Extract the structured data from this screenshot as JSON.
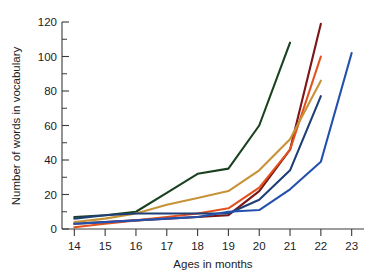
{
  "chart_data": {
    "type": "line",
    "title": "",
    "xlabel": "Ages in months",
    "ylabel": "Number of words in vocabulary",
    "x": [
      14,
      15,
      16,
      17,
      18,
      19,
      20,
      21,
      22,
      23
    ],
    "xlim": [
      13.6,
      23.4
    ],
    "ylim": [
      0,
      120
    ],
    "xticks": [
      "14",
      "15",
      "16",
      "17",
      "18",
      "19",
      "20",
      "21",
      "22",
      "23"
    ],
    "yticks": [
      "0",
      "20",
      "40",
      "60",
      "80",
      "100",
      "120"
    ],
    "ytick_values": [
      0,
      20,
      40,
      60,
      80,
      100,
      120
    ],
    "minor_ticks": true,
    "grid": false,
    "legend": "none",
    "series": [
      {
        "name": "child-1",
        "color": "#1b4220",
        "x": [
          14,
          15,
          16,
          17,
          18,
          19,
          20,
          21
        ],
        "values": [
          7,
          8,
          10,
          21,
          32,
          35,
          60,
          108
        ]
      },
      {
        "name": "child-2",
        "color": "#7d1416",
        "x": [
          14,
          15,
          16,
          17,
          18,
          19,
          20,
          21,
          22
        ],
        "values": [
          3,
          4,
          5,
          6,
          7,
          8,
          22,
          46,
          119
        ]
      },
      {
        "name": "child-3",
        "color": "#e2521d",
        "x": [
          14,
          15,
          16,
          17,
          18,
          19,
          20,
          21,
          22
        ],
        "values": [
          1,
          3,
          5,
          7,
          9,
          12,
          24,
          46,
          100
        ]
      },
      {
        "name": "child-4",
        "color": "#c79338",
        "x": [
          14,
          15,
          16,
          17,
          18,
          19,
          20,
          21,
          22
        ],
        "values": [
          4,
          6,
          9,
          14,
          18,
          22,
          34,
          52,
          86
        ]
      },
      {
        "name": "child-5",
        "color": "#1f3f77",
        "x": [
          14,
          15,
          16,
          17,
          18,
          19,
          20,
          21,
          22
        ],
        "values": [
          6,
          8,
          9,
          9,
          9,
          9,
          17,
          34,
          77
        ]
      },
      {
        "name": "child-6",
        "color": "#2450ad",
        "x": [
          14,
          15,
          16,
          17,
          18,
          19,
          20,
          21,
          22,
          23
        ],
        "values": [
          3,
          4,
          5,
          6,
          7,
          10,
          11,
          23,
          39,
          102
        ]
      }
    ]
  },
  "axes": {
    "x_title": "Ages in months",
    "y_title": "Number of words in vocabulary"
  }
}
